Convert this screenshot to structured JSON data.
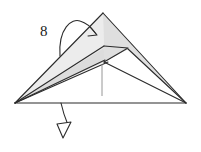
{
  "diagram": {
    "type": "origami-fold-step",
    "step_number": "8",
    "title_visible": false,
    "background_color": "#ffffff",
    "line_color": "#2b2b2b",
    "fill_colors": {
      "paper_light": "#e9e9e9",
      "paper_mid": "#dedede",
      "paper_dark": "#d2d2d2",
      "paper_white": "#ffffff"
    },
    "annotations": {
      "step_label": "8",
      "fold_arrow_top": "curved-fold-arrow",
      "fold_arrow_bottom": "curved-fold-arrow-down",
      "crease_line": "valley-crease-line"
    },
    "geometry": {
      "left_vertex": [
        15,
        103
      ],
      "right_vertex": [
        186,
        103
      ],
      "apex": [
        103,
        13
      ],
      "flap_tip": [
        128,
        48
      ],
      "inner_notch": [
        104,
        62
      ],
      "baseline_y": 103
    },
    "icons": [
      {
        "name": "step-number",
        "label": "8"
      },
      {
        "name": "fold-arrow-top",
        "label": "fold arrow pointing right"
      },
      {
        "name": "fold-arrow-bottom",
        "label": "fold arrow pointing down"
      }
    ]
  }
}
